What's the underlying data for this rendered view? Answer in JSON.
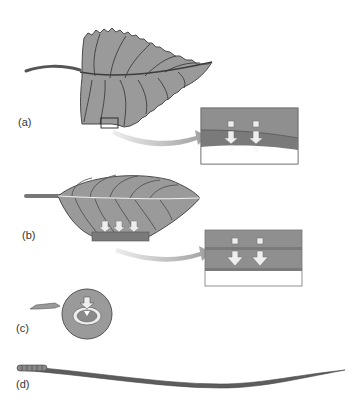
{
  "figure": {
    "panels": [
      {
        "id": "a",
        "label": "(a)",
        "subject": "serrated broad leaf with magnified cross-section inset"
      },
      {
        "id": "b",
        "label": "(b)",
        "subject": "ovate leaf with magnified cross-section inset"
      },
      {
        "id": "c",
        "label": "(c)",
        "subject": "circular leaf with central arrow"
      },
      {
        "id": "d",
        "label": "(d)",
        "subject": "needle-like leaf"
      }
    ],
    "colors": {
      "leaf_fill": "#9a9a9a",
      "leaf_outline": "#4a4a4a",
      "vein": "#3d3d3d",
      "inset_top": "#8f8f8f",
      "inset_band": "#7a7a7a",
      "inset_bottom": "#ffffff",
      "arrow": "#eeeeee",
      "pointer_arrow": "#b8b8b8"
    }
  }
}
